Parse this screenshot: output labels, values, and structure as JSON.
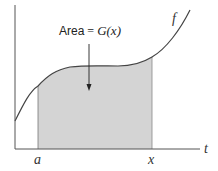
{
  "diagram": {
    "annotation": {
      "word": "Area",
      "eq": " = ",
      "func": "G",
      "arg": "(x)",
      "full": "Area = G(x)"
    },
    "curve_label": "f",
    "x_axis_label": "t",
    "tick_labels": {
      "lower": "a",
      "upper": "x"
    },
    "colors": {
      "shade": "#d4d4d4",
      "line": "#444444",
      "axis": "#555555"
    }
  }
}
